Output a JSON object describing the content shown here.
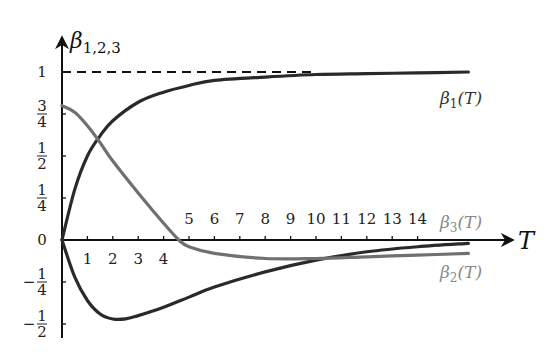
{
  "chart_data": {
    "type": "line",
    "title": "",
    "xlabel": "T",
    "ylabel": "β_{1,2,3}",
    "xlim": [
      0,
      16
    ],
    "ylim": [
      -0.5,
      1
    ],
    "grid": false,
    "x_ticks": [
      1,
      2,
      3,
      4,
      5,
      6,
      7,
      8,
      9,
      10,
      11,
      12,
      13,
      14
    ],
    "y_ticks": [
      {
        "value": 1,
        "label": "1"
      },
      {
        "value": 0.75,
        "label": "3/4"
      },
      {
        "value": 0.5,
        "label": "1/2"
      },
      {
        "value": 0.25,
        "label": "1/4"
      },
      {
        "value": 0,
        "label": "0"
      },
      {
        "value": -0.25,
        "label": "−1/4"
      },
      {
        "value": -0.5,
        "label": "−1/2"
      }
    ],
    "reference_line": {
      "y": 1,
      "style": "dashed",
      "x_range": [
        0,
        10
      ]
    },
    "series": [
      {
        "name": "β1(T)",
        "label_main": "β",
        "label_sub": "1",
        "label_arg": "(T)",
        "color": "#2a2a2a",
        "x": [
          0,
          0.5,
          1,
          1.5,
          2,
          3,
          4,
          5,
          6,
          8,
          10,
          12,
          14,
          16
        ],
        "values": [
          0,
          0.3,
          0.5,
          0.62,
          0.71,
          0.82,
          0.88,
          0.92,
          0.95,
          0.97,
          0.985,
          0.99,
          0.995,
          1.0
        ]
      },
      {
        "name": "β2(T)",
        "label_main": "β",
        "label_sub": "2",
        "label_arg": "(T)",
        "color": "#2a2a2a",
        "x": [
          0,
          0.5,
          1,
          1.5,
          2,
          2.5,
          3,
          4,
          5,
          6,
          8,
          10,
          12,
          14,
          16
        ],
        "values": [
          0,
          -0.22,
          -0.36,
          -0.44,
          -0.47,
          -0.47,
          -0.45,
          -0.4,
          -0.34,
          -0.28,
          -0.19,
          -0.12,
          -0.07,
          -0.04,
          -0.02
        ]
      },
      {
        "name": "β3(T)",
        "label_main": "β",
        "label_sub": "3",
        "label_arg": "(T)",
        "color": "#707070",
        "x": [
          0,
          0.5,
          1,
          1.5,
          2,
          3,
          4,
          4.6,
          5,
          6,
          8,
          10,
          12,
          14,
          16
        ],
        "values": [
          0.8,
          0.76,
          0.68,
          0.58,
          0.47,
          0.28,
          0.1,
          0,
          -0.04,
          -0.08,
          -0.11,
          -0.11,
          -0.1,
          -0.09,
          -0.08
        ]
      }
    ]
  }
}
